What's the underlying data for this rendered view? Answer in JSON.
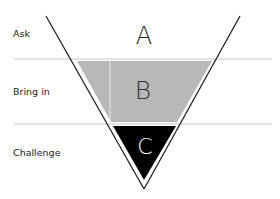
{
  "diagram": {
    "type": "inverted-funnel",
    "rows": [
      {
        "label": "Ask",
        "letter": "A",
        "fill": "#ffffff",
        "letter_color": "#222222"
      },
      {
        "label": "Bring in",
        "letter": "B",
        "fill": "#b8b8b8",
        "letter_color": "#333333"
      },
      {
        "label": "Challenge",
        "letter": "C",
        "fill": "#000000",
        "letter_color": "#ffffff"
      }
    ],
    "colors": {
      "outline": "#222222",
      "separator": "#c8c8c8",
      "band_gray": "#b8b8b8",
      "band_black": "#000000"
    }
  }
}
